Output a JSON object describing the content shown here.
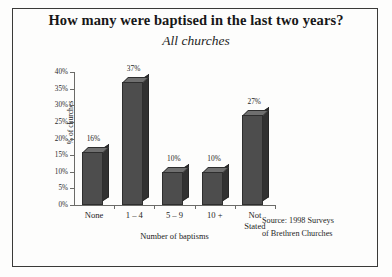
{
  "figure": {
    "title": "How many were baptised in the last two years?",
    "subtitle": "All churches",
    "source_line1": "Source: 1998 Surveys",
    "source_line2": "of Brethren Churches",
    "frame_color": "#3a3a38",
    "background": "#fdfdfc"
  },
  "chart_data": {
    "type": "bar",
    "title": "How many were baptised in the last two years?",
    "subtitle": "All churches",
    "categories": [
      "None",
      "1 – 4",
      "5 – 9",
      "10 +",
      "Not\nStated"
    ],
    "category_labels": [
      {
        "line1": "None",
        "line2": ""
      },
      {
        "line1": "1 – 4",
        "line2": ""
      },
      {
        "line1": "5 – 9",
        "line2": ""
      },
      {
        "line1": "10 +",
        "line2": ""
      },
      {
        "line1": "Not",
        "line2": "Stated"
      }
    ],
    "values": [
      16,
      37,
      10,
      10,
      27
    ],
    "value_labels": [
      "16%",
      "37%",
      "10%",
      "10%",
      "27%"
    ],
    "xlabel": "Number of baptisms",
    "ylabel": "% of churches",
    "ylim": [
      0,
      40
    ],
    "ytick_values": [
      0,
      5,
      10,
      15,
      20,
      25,
      30,
      35,
      40
    ],
    "ytick_labels": [
      "0%",
      "5%",
      "10%",
      "15%",
      "20%",
      "25%",
      "30%",
      "35%",
      "40%"
    ],
    "grid": false,
    "legend": false,
    "bar_front_color": "#4d4d4d",
    "bar_side_color": "#313131",
    "bar_top_color": "#6f6f6f",
    "axis_color": "#6b6b68"
  }
}
